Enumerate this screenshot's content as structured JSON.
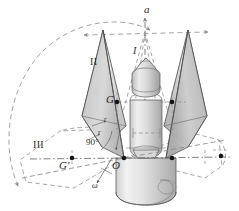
{
  "figure": {
    "kind": "engineering-diagram",
    "background": "#ffffff"
  },
  "labels": {
    "axis_a": "a",
    "cone_one": "I",
    "cone_two": "II",
    "cone_three": "III",
    "center_of_gravity": "G",
    "center_of_gravity_prime": "G′",
    "origin": "O",
    "right_angle": "90°",
    "angular_velocity": "ω",
    "radius_upper": "r",
    "radius_lower": "r"
  },
  "colors": {
    "outline": "#3a3a3a",
    "dashed": "#8a8a8a",
    "fill_light": "#e9e9e9",
    "fill_mid": "#d2d2d2",
    "fill_dark": "#b9b9b9",
    "point": "#1a1a1a",
    "text": "#2b2b2b"
  },
  "geometry": {
    "origin_point": {
      "x": 124,
      "y": 158
    },
    "apex_point": {
      "x": 145,
      "y": 32
    },
    "g_point": {
      "x": 117,
      "y": 102
    },
    "g_prime_point": {
      "x": 72,
      "y": 158
    },
    "right_point": {
      "x": 172,
      "y": 158
    },
    "far_right_point": {
      "x": 221,
      "y": 158
    }
  }
}
